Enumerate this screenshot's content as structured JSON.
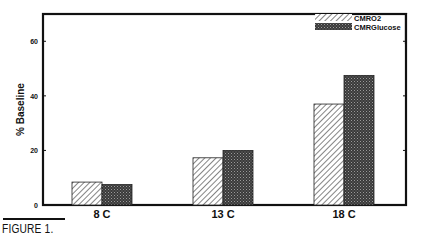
{
  "chart_data": {
    "type": "bar",
    "title": "",
    "xlabel": "",
    "ylabel": "% Baseline",
    "ylim": [
      0,
      70
    ],
    "yticks": [
      0,
      20,
      40,
      60
    ],
    "grid": false,
    "legend_position": "top-right",
    "categories": [
      "8 C",
      "13 C",
      "18 C"
    ],
    "series": [
      {
        "name": "CMRO2",
        "pattern": "diagonal-hatch",
        "values": [
          8.4,
          17.3,
          37
        ]
      },
      {
        "name": "CMRGlucose",
        "pattern": "dark-stipple",
        "values": [
          7.5,
          20,
          47.5
        ]
      }
    ]
  },
  "caption": "FIGURE 1.",
  "colors": {
    "ink": "#111111",
    "hatch_bg": "#ffffff",
    "stipple": "#444444"
  }
}
